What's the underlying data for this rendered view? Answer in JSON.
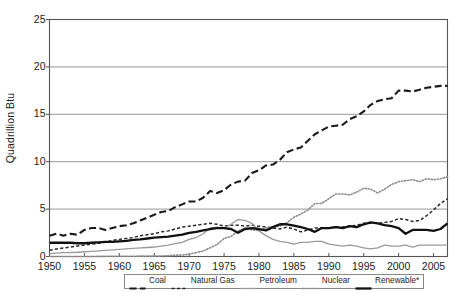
{
  "chart_data": {
    "type": "line",
    "title": "",
    "xlabel": "",
    "ylabel": "Quadrillion Btu",
    "xlim": [
      1950,
      2007
    ],
    "ylim": [
      0,
      25
    ],
    "ytick_values": [
      0,
      5,
      10,
      15,
      20,
      25
    ],
    "ytick_labels": [
      "0",
      "5",
      "10",
      "15",
      "20",
      "25"
    ],
    "xtick_values": [
      1950,
      1955,
      1960,
      1965,
      1970,
      1975,
      1980,
      1985,
      1990,
      1995,
      2000,
      2005
    ],
    "xtick_labels": [
      "1950",
      "1955",
      "1960",
      "1965",
      "1970",
      "1975",
      "1980",
      "1985",
      "1990",
      "1995",
      "2000",
      "2005"
    ],
    "grid": "horizontal",
    "legend_position": "bottom-center",
    "x": [
      1950,
      1951,
      1952,
      1953,
      1954,
      1955,
      1956,
      1957,
      1958,
      1959,
      1960,
      1961,
      1962,
      1963,
      1964,
      1965,
      1966,
      1967,
      1968,
      1969,
      1970,
      1971,
      1972,
      1973,
      1974,
      1975,
      1976,
      1977,
      1978,
      1979,
      1980,
      1981,
      1982,
      1983,
      1984,
      1985,
      1986,
      1987,
      1988,
      1989,
      1990,
      1991,
      1992,
      1993,
      1994,
      1995,
      1996,
      1997,
      1998,
      1999,
      2000,
      2001,
      2002,
      2003,
      2004,
      2005,
      2006,
      2007
    ],
    "series": [
      {
        "name": "Coal",
        "style": "long-dash",
        "color": "#1a1a1a",
        "width": 2.1,
        "values": [
          2.2,
          2.4,
          2.2,
          2.4,
          2.3,
          2.8,
          3.0,
          3.0,
          2.8,
          3.0,
          3.2,
          3.3,
          3.5,
          3.8,
          4.1,
          4.4,
          4.7,
          4.8,
          5.2,
          5.5,
          5.8,
          5.8,
          6.2,
          6.9,
          6.7,
          7.0,
          7.6,
          7.9,
          8.0,
          8.8,
          9.1,
          9.6,
          9.7,
          10.2,
          11.0,
          11.3,
          11.5,
          12.2,
          12.9,
          13.3,
          13.7,
          13.8,
          13.9,
          14.5,
          14.8,
          15.3,
          16.0,
          16.4,
          16.6,
          16.7,
          17.5,
          17.5,
          17.4,
          17.6,
          17.8,
          17.9,
          18.0,
          18.0
        ],
        "values_display": [
          2.2,
          2.4,
          2.2,
          2.4,
          2.3,
          2.8,
          3.0,
          3.0,
          2.8,
          3.0,
          3.2,
          3.3,
          3.5,
          3.8,
          4.1,
          4.4,
          4.7,
          4.8,
          5.2,
          5.5,
          5.8,
          5.8,
          6.2,
          6.9,
          6.7,
          7.0,
          7.6,
          7.9,
          8.0,
          8.8,
          9.1,
          9.6,
          9.7,
          10.2,
          11.0,
          11.3,
          11.5,
          12.2,
          12.9,
          13.3,
          13.7,
          13.8,
          13.9,
          14.5,
          14.8,
          15.3,
          16.0,
          16.4,
          16.6,
          16.7,
          17.5,
          17.5,
          17.4,
          17.6,
          17.8,
          17.9,
          18.0,
          18.0
        ]
      },
      {
        "name": "Natural Gas",
        "style": "short-dash",
        "color": "#2a2a2a",
        "width": 1.5,
        "values": [
          0.65,
          0.8,
          0.9,
          1.0,
          1.1,
          1.2,
          1.3,
          1.4,
          1.5,
          1.7,
          1.8,
          1.9,
          2.0,
          2.2,
          2.3,
          2.4,
          2.6,
          2.7,
          2.9,
          3.1,
          3.2,
          3.3,
          3.4,
          3.5,
          3.4,
          3.2,
          3.3,
          3.3,
          3.2,
          3.3,
          3.2,
          3.1,
          3.0,
          2.9,
          3.1,
          2.9,
          2.6,
          2.8,
          3.0,
          3.0,
          3.0,
          3.1,
          3.1,
          3.2,
          3.3,
          3.5,
          3.5,
          3.5,
          3.6,
          3.7,
          4.0,
          3.9,
          3.7,
          3.8,
          4.3,
          4.9,
          5.6,
          6.1
        ],
        "values_display": [
          0.65,
          0.8,
          0.9,
          1.0,
          1.1,
          1.2,
          1.3,
          1.4,
          1.5,
          1.7,
          1.8,
          1.9,
          2.0,
          2.2,
          2.3,
          2.4,
          2.6,
          2.7,
          2.9,
          3.1,
          3.2,
          3.3,
          3.4,
          3.5,
          3.4,
          3.2,
          3.3,
          3.3,
          3.2,
          3.3,
          3.2,
          3.1,
          3.0,
          2.9,
          3.1,
          2.9,
          2.6,
          2.8,
          3.0,
          3.0,
          3.0,
          3.1,
          3.1,
          3.2,
          3.3,
          3.5,
          3.5,
          3.5,
          3.6,
          3.7,
          4.0,
          3.9,
          3.7,
          3.8,
          4.3,
          4.9,
          5.6,
          6.1
        ]
      },
      {
        "name": "Petroleum",
        "style": "solid-thin",
        "color": "#9a9a9a",
        "width": 1.3,
        "values": [
          0.3,
          0.35,
          0.4,
          0.42,
          0.45,
          0.5,
          0.55,
          0.6,
          0.65,
          0.7,
          0.75,
          0.8,
          0.85,
          0.9,
          0.95,
          1.0,
          1.1,
          1.2,
          1.35,
          1.5,
          1.8,
          2.0,
          2.4,
          3.0,
          3.1,
          3.0,
          3.4,
          3.9,
          3.8,
          3.5,
          2.7,
          2.2,
          1.8,
          1.6,
          1.5,
          1.3,
          1.5,
          1.5,
          1.6,
          1.6,
          1.3,
          1.2,
          1.1,
          1.2,
          1.1,
          0.9,
          0.8,
          0.9,
          1.2,
          1.1,
          1.1,
          1.2,
          1.0,
          1.2,
          1.2,
          1.2,
          1.2,
          1.2
        ],
        "values_display": [
          0.3,
          0.35,
          0.4,
          0.42,
          0.45,
          0.5,
          0.55,
          0.6,
          0.65,
          0.7,
          0.75,
          0.8,
          0.85,
          0.9,
          0.95,
          1.0,
          1.1,
          1.2,
          1.35,
          1.5,
          1.8,
          2.0,
          2.4,
          3.0,
          3.1,
          3.0,
          3.4,
          3.9,
          3.8,
          3.5,
          2.7,
          2.2,
          1.8,
          1.6,
          1.5,
          1.3,
          1.5,
          1.5,
          1.6,
          1.6,
          1.3,
          1.2,
          1.1,
          1.2,
          1.1,
          0.9,
          0.8,
          0.9,
          1.2,
          1.1,
          1.1,
          1.2,
          1.0,
          1.2,
          1.2,
          1.2,
          1.2,
          1.2
        ]
      },
      {
        "name": "Nuclear",
        "style": "dotted",
        "color": "#8f8f8f",
        "width": 1.6,
        "values": [
          0,
          0,
          0,
          0,
          0,
          0,
          0,
          0.01,
          0.02,
          0.02,
          0.03,
          0.03,
          0.03,
          0.04,
          0.04,
          0.04,
          0.06,
          0.09,
          0.14,
          0.15,
          0.24,
          0.41,
          0.58,
          0.91,
          1.27,
          1.9,
          2.11,
          2.7,
          3.0,
          2.8,
          2.74,
          3.01,
          3.13,
          3.2,
          3.55,
          4.15,
          4.47,
          4.91,
          5.59,
          5.6,
          6.1,
          6.6,
          6.6,
          6.5,
          6.8,
          7.2,
          7.1,
          6.7,
          7.1,
          7.6,
          7.9,
          8.0,
          8.1,
          7.9,
          8.2,
          8.1,
          8.2,
          8.4
        ],
        "values_display": [
          0,
          0,
          0,
          0,
          0,
          0,
          0,
          0.01,
          0.02,
          0.02,
          0.03,
          0.03,
          0.03,
          0.04,
          0.04,
          0.04,
          0.06,
          0.09,
          0.14,
          0.15,
          0.24,
          0.41,
          0.58,
          0.91,
          1.27,
          1.9,
          2.11,
          2.7,
          3.0,
          2.8,
          2.74,
          3.01,
          3.13,
          3.2,
          3.55,
          4.15,
          4.47,
          4.91,
          5.59,
          5.6,
          6.1,
          6.6,
          6.6,
          6.5,
          6.8,
          7.2,
          7.1,
          6.7,
          7.1,
          7.6,
          7.9,
          8.0,
          8.1,
          7.9,
          8.2,
          8.1,
          8.2,
          8.4
        ]
      },
      {
        "name": "Renewable*",
        "style": "solid-thick",
        "color": "#111111",
        "width": 2.3,
        "values": [
          1.45,
          1.45,
          1.45,
          1.45,
          1.4,
          1.4,
          1.45,
          1.5,
          1.55,
          1.55,
          1.6,
          1.65,
          1.75,
          1.8,
          1.9,
          2.0,
          2.05,
          2.1,
          2.2,
          2.3,
          2.5,
          2.6,
          2.75,
          2.9,
          3.0,
          3.0,
          2.9,
          2.5,
          2.9,
          3.0,
          2.9,
          2.75,
          3.1,
          3.4,
          3.4,
          3.25,
          3.1,
          2.9,
          2.6,
          3.0,
          3.0,
          3.1,
          3.0,
          3.2,
          3.1,
          3.4,
          3.6,
          3.5,
          3.3,
          3.2,
          3.0,
          2.4,
          2.8,
          2.8,
          2.8,
          2.7,
          2.9,
          3.5
        ],
        "values_display": [
          1.45,
          1.45,
          1.45,
          1.45,
          1.4,
          1.4,
          1.45,
          1.5,
          1.55,
          1.55,
          1.6,
          1.65,
          1.75,
          1.8,
          1.9,
          2.0,
          2.05,
          2.1,
          2.2,
          2.3,
          2.5,
          2.6,
          2.75,
          2.9,
          3.0,
          3.0,
          2.9,
          2.5,
          2.9,
          3.0,
          2.9,
          2.75,
          3.1,
          3.4,
          3.4,
          3.25,
          3.1,
          2.9,
          2.6,
          3.0,
          3.0,
          3.1,
          3.0,
          3.2,
          3.1,
          3.4,
          3.6,
          3.5,
          3.3,
          3.2,
          3.0,
          2.4,
          2.8,
          2.8,
          2.8,
          2.7,
          2.9,
          3.5
        ]
      }
    ]
  },
  "legend": {
    "items": [
      {
        "label": "Coal",
        "style": "long-dash"
      },
      {
        "label": "Natural Gas",
        "style": "short-dash"
      },
      {
        "label": "Petroleum",
        "style": "solid-thin"
      },
      {
        "label": "Nuclear",
        "style": "dotted"
      },
      {
        "label": "Renewable*",
        "style": "solid-thick"
      }
    ]
  },
  "footnote": {
    "text": ""
  },
  "colors": {
    "axis": "#555555",
    "grid": "#8a8a8a",
    "dark_line": "#1a1a1a",
    "gray_line": "#9a9a9a",
    "background": "#ffffff"
  }
}
